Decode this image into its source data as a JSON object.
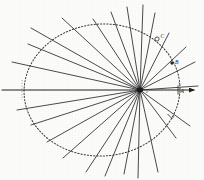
{
  "figure": {
    "background_color": "#fdfdfc",
    "ink_color": "#2b2b2b",
    "width": 204,
    "height": 180
  },
  "ellipse": {
    "name": "dotted-ellipse",
    "center_x": 102,
    "center_y": 90,
    "radius_x": 78,
    "radius_y": 66,
    "rotation_deg": -4,
    "style": "dotted",
    "stroke_color": "#3a3a3a"
  },
  "axis": {
    "name": "major-axis",
    "x1": 2,
    "y1": 90,
    "x2": 198,
    "y2": 90,
    "has_arrowhead": true,
    "stroke_color": "#1f1f1f"
  },
  "focus": {
    "label": "c",
    "x": 140,
    "y": 90,
    "marker": "filled-blob"
  },
  "labeled_points": [
    {
      "id": "point-c",
      "label": "C",
      "x": 157,
      "y": 39,
      "marker": "open-ring"
    },
    {
      "id": "point-b",
      "label": "B",
      "x": 172,
      "y": 63,
      "marker": "filled-dot"
    },
    {
      "id": "point-a",
      "label": "A",
      "x": 179,
      "y": 90,
      "marker": "tick"
    },
    {
      "id": "point-x",
      "label": "x",
      "x": 170,
      "y": 117,
      "marker": "tick"
    }
  ],
  "chart_data": {
    "type": "scatter",
    "xlabel": "",
    "ylabel": "",
    "xlim": [
      0,
      204
    ],
    "ylim": [
      0,
      180
    ],
    "grid": false,
    "legend_position": "none",
    "focus_point": {
      "x": 140,
      "y": 90,
      "label": "c"
    },
    "ellipse_params": {
      "center": [
        102,
        90
      ],
      "semi_major": 78,
      "semi_minor": 66,
      "rotation_deg": -4
    },
    "rays": [
      {
        "index": 1,
        "angle_deg": 4,
        "x1": 140,
        "y1": 90,
        "x2": 198,
        "y2": 86
      },
      {
        "index": 2,
        "angle_deg": 27,
        "x1": 140,
        "y1": 90,
        "x2": 195,
        "y2": 62
      },
      {
        "index": 3,
        "angle_deg": 43,
        "x1": 140,
        "y1": 90,
        "x2": 186,
        "y2": 47
      },
      {
        "index": 4,
        "angle_deg": 63,
        "x1": 140,
        "y1": 90,
        "x2": 169,
        "y2": 33
      },
      {
        "index": 5,
        "angle_deg": 76,
        "x1": 140,
        "y1": 90,
        "x2": 155,
        "y2": 13
      },
      {
        "index": 6,
        "angle_deg": 87,
        "x1": 140,
        "y1": 90,
        "x2": 143,
        "y2": 5
      },
      {
        "index": 7,
        "angle_deg": 99,
        "x1": 140,
        "y1": 90,
        "x2": 127,
        "y2": 7
      },
      {
        "index": 8,
        "angle_deg": 111,
        "x1": 140,
        "y1": 90,
        "x2": 111,
        "y2": 12
      },
      {
        "index": 9,
        "angle_deg": 124,
        "x1": 140,
        "y1": 90,
        "x2": 93,
        "y2": 19
      },
      {
        "index": 10,
        "angle_deg": 137,
        "x1": 140,
        "y1": 90,
        "x2": 62,
        "y2": 18
      },
      {
        "index": 11,
        "angle_deg": 150,
        "x1": 140,
        "y1": 90,
        "x2": 31,
        "y2": 28
      },
      {
        "index": 12,
        "angle_deg": 162,
        "x1": 140,
        "y1": 90,
        "x2": 28,
        "y2": 44
      },
      {
        "index": 13,
        "angle_deg": 172,
        "x1": 140,
        "y1": 90,
        "x2": 12,
        "y2": 62
      },
      {
        "index": 14,
        "angle_deg": 189,
        "x1": 140,
        "y1": 90,
        "x2": 17,
        "y2": 110
      },
      {
        "index": 15,
        "angle_deg": 200,
        "x1": 140,
        "y1": 90,
        "x2": 31,
        "y2": 125
      },
      {
        "index": 16,
        "angle_deg": 212,
        "x1": 140,
        "y1": 90,
        "x2": 47,
        "y2": 142
      },
      {
        "index": 17,
        "angle_deg": 223,
        "x1": 140,
        "y1": 90,
        "x2": 63,
        "y2": 158
      },
      {
        "index": 18,
        "angle_deg": 234,
        "x1": 140,
        "y1": 90,
        "x2": 86,
        "y2": 172
      },
      {
        "index": 19,
        "angle_deg": 246,
        "x1": 140,
        "y1": 90,
        "x2": 105,
        "y2": 176
      },
      {
        "index": 20,
        "angle_deg": 258,
        "x1": 140,
        "y1": 90,
        "x2": 124,
        "y2": 174
      },
      {
        "index": 21,
        "angle_deg": 271,
        "x1": 140,
        "y1": 90,
        "x2": 138,
        "y2": 178
      },
      {
        "index": 22,
        "angle_deg": 285,
        "x1": 140,
        "y1": 90,
        "x2": 158,
        "y2": 172
      },
      {
        "index": 23,
        "angle_deg": 302,
        "x1": 140,
        "y1": 90,
        "x2": 176,
        "y2": 138
      },
      {
        "index": 24,
        "angle_deg": 318,
        "x1": 140,
        "y1": 90,
        "x2": 190,
        "y2": 126
      }
    ],
    "annotations": [
      {
        "text": "C",
        "x": 157,
        "y": 39
      },
      {
        "text": "B",
        "x": 172,
        "y": 63
      },
      {
        "text": "A",
        "x": 179,
        "y": 90
      },
      {
        "text": "x",
        "x": 170,
        "y": 117
      },
      {
        "text": "c",
        "x": 146,
        "y": 92
      }
    ]
  }
}
